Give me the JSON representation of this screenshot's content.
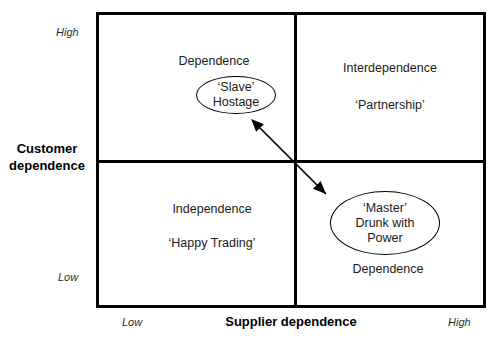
{
  "diagram": {
    "axes": {
      "y_title_line1": "Customer",
      "y_title_line2": "dependence",
      "y_high": "High",
      "y_low": "Low",
      "x_title": "Supplier dependence",
      "x_low": "Low",
      "x_high": "High"
    },
    "quadrants": {
      "top_left": {
        "title": "Dependence",
        "bubble_line1": "‘Slave’",
        "bubble_line2": "Hostage"
      },
      "top_right": {
        "title": "Interdependence",
        "subtitle": "‘Partnership’"
      },
      "bottom_left": {
        "title": "Independence",
        "subtitle": "‘Happy Trading’"
      },
      "bottom_right": {
        "bubble_line1": "‘Master’",
        "bubble_line2": "Drunk with",
        "bubble_line3": "Power",
        "subtitle": "Dependence"
      }
    },
    "connector": {
      "name": "double-headed-arrow",
      "from": "top_left_bubble",
      "to": "bottom_right_bubble"
    },
    "colors": {
      "frame": "#000000",
      "text": "#1a1a1a",
      "background": "#ffffff"
    }
  }
}
